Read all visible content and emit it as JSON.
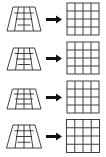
{
  "figure": {
    "background_color": "#ffffff",
    "line_color": "#2b2b2b",
    "arrow_color": "#111111",
    "width": 106,
    "height": 157,
    "row_count": 4,
    "rows": [
      {
        "index": 1,
        "source": {
          "shape_name": "perspective-trapezoid-grid",
          "columns": 4,
          "rows": 4,
          "top_width": 22,
          "bottom_width": 36,
          "height": 24,
          "center_x": 24,
          "center_y": 19
        },
        "arrow": {
          "icon": "arrow-right-icon",
          "label": "maps to"
        },
        "target": {
          "shape_name": "square-grid",
          "columns": 4,
          "rows": 4,
          "size": 32,
          "center_x": 18,
          "center_y": 19
        }
      },
      {
        "index": 2,
        "source": {
          "shape_name": "perspective-trapezoid-grid",
          "columns": 4,
          "rows": 4,
          "top_width": 21,
          "bottom_width": 36,
          "height": 22,
          "center_x": 24,
          "center_y": 19
        },
        "arrow": {
          "icon": "arrow-right-icon",
          "label": "maps to"
        },
        "target": {
          "shape_name": "square-grid",
          "columns": 4,
          "rows": 4,
          "size": 32,
          "center_x": 18,
          "center_y": 19
        }
      },
      {
        "index": 3,
        "source": {
          "shape_name": "perspective-trapezoid-grid",
          "columns": 4,
          "rows": 4,
          "top_width": 23,
          "bottom_width": 36,
          "height": 20,
          "center_x": 24,
          "center_y": 19
        },
        "arrow": {
          "icon": "arrow-right-icon",
          "label": "maps to"
        },
        "target": {
          "shape_name": "square-grid",
          "columns": 4,
          "rows": 4,
          "size": 32,
          "center_x": 18,
          "center_y": 19
        }
      },
      {
        "index": 4,
        "source": {
          "shape_name": "perspective-trapezoid-grid",
          "columns": 4,
          "rows": 4,
          "top_width": 22,
          "bottom_width": 37,
          "height": 23,
          "center_x": 24,
          "center_y": 19
        },
        "arrow": {
          "icon": "arrow-right-icon",
          "label": "maps to"
        },
        "target": {
          "shape_name": "square-grid",
          "columns": 4,
          "rows": 4,
          "size": 33,
          "center_x": 18,
          "center_y": 19
        }
      }
    ]
  }
}
